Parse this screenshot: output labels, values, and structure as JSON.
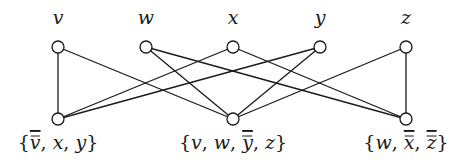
{
  "diagram": {
    "type": "bipartite-graph",
    "variables": [
      {
        "id": "v",
        "label": "v"
      },
      {
        "id": "w",
        "label": "w"
      },
      {
        "id": "x",
        "label": "x"
      },
      {
        "id": "y",
        "label": "y"
      },
      {
        "id": "z",
        "label": "z"
      }
    ],
    "clauses": [
      {
        "id": "C1",
        "literals": [
          {
            "var": "v",
            "negated": true
          },
          {
            "var": "x",
            "negated": false
          },
          {
            "var": "y",
            "negated": false
          }
        ]
      },
      {
        "id": "C2",
        "literals": [
          {
            "var": "v",
            "negated": false
          },
          {
            "var": "w",
            "negated": false
          },
          {
            "var": "y",
            "negated": true
          },
          {
            "var": "z",
            "negated": false
          }
        ]
      },
      {
        "id": "C3",
        "literals": [
          {
            "var": "w",
            "negated": false
          },
          {
            "var": "x",
            "negated": true
          },
          {
            "var": "z",
            "negated": true
          }
        ]
      }
    ],
    "edges": [
      [
        "v",
        "C1"
      ],
      [
        "v",
        "C2"
      ],
      [
        "w",
        "C2"
      ],
      [
        "w",
        "C3"
      ],
      [
        "x",
        "C1"
      ],
      [
        "x",
        "C3"
      ],
      [
        "y",
        "C1"
      ],
      [
        "y",
        "C2"
      ],
      [
        "z",
        "C2"
      ],
      [
        "z",
        "C3"
      ]
    ],
    "colors": {
      "stroke": "#1a1a1a",
      "node_fill": "#ffffff",
      "background": "#ffffff"
    }
  }
}
